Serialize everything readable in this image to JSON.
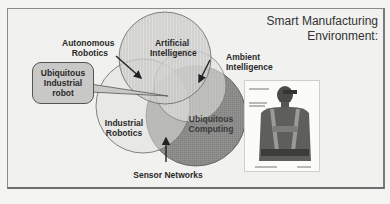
{
  "title": {
    "line1": "Smart  Manufacturing",
    "line2": "Environment:"
  },
  "venn": {
    "circles": [
      {
        "id": "ai",
        "label_line1": "Artificial",
        "label_line2": "Intelligence",
        "fill": "#c9c9c7"
      },
      {
        "id": "industrial-robotics",
        "label_line1": "Industrial",
        "label_line2": "Robotics",
        "fill": "#d9d9d7"
      },
      {
        "id": "ubiquitous-computing",
        "label_line1": "Ubiquitous",
        "label_line2": "Computing",
        "fill": "#8e8e8c"
      }
    ],
    "external_labels": {
      "autonomous_robotics": {
        "line1": "Autonomous",
        "line2": "Robotics"
      },
      "ambient_intelligence": {
        "line1": "Ambient",
        "line2": "Intelligence"
      },
      "sensor_networks": "Sensor Networks"
    },
    "callout": {
      "line1": "Ubiquitous",
      "line2": "Industrial",
      "line3": "robot"
    }
  },
  "photo": {
    "caption_top": "See-through display",
    "caption_mid": "Wearable computer and modules",
    "caption_bottom_left": "Wearable computer belt",
    "caption_bottom_right": "Battery"
  },
  "colors": {
    "frame_border": "#8a8a8a",
    "background": "#f1f1ef",
    "text": "#2a2a2a",
    "dark_circle": "#8e8e8c"
  }
}
